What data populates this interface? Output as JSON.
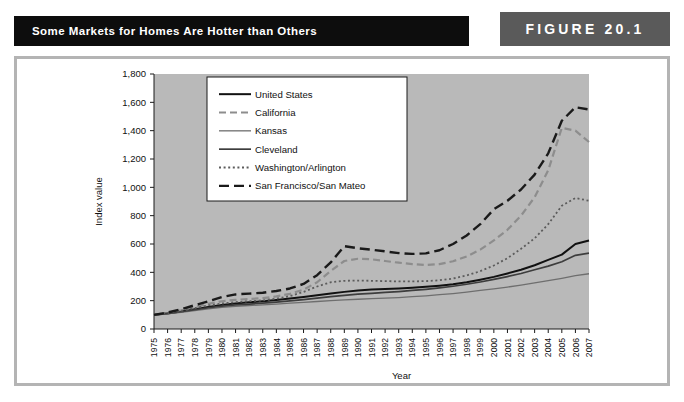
{
  "header": {
    "title": "Some Markets for Homes Are Hotter than Others",
    "figure_label": "FIGURE 20.1"
  },
  "chart_data": {
    "type": "line",
    "title": "Some Markets for Homes Are Hotter than Others",
    "xlabel": "Year",
    "ylabel": "Index value",
    "ylim": [
      0,
      1800
    ],
    "ytick_step": 200,
    "yticks": [
      "0",
      "200",
      "400",
      "600",
      "800",
      "1,000",
      "1,200",
      "1,400",
      "1,600",
      "1,800"
    ],
    "grid": false,
    "legend_position": "top-left-inside",
    "plot_background": "#b9b9b9",
    "x": [
      1975,
      1976,
      1977,
      1978,
      1979,
      1980,
      1981,
      1982,
      1983,
      1984,
      1985,
      1986,
      1987,
      1988,
      1989,
      1990,
      1991,
      1992,
      1993,
      1994,
      1995,
      1996,
      1997,
      1998,
      1999,
      2000,
      2001,
      2002,
      2003,
      2004,
      2005,
      2006,
      2007
    ],
    "xticklabels": [
      "1975",
      "1976",
      "1977",
      "1978",
      "1979",
      "1980",
      "1981",
      "1982",
      "1983",
      "1984",
      "1985",
      "1986",
      "1987",
      "1988",
      "1989",
      "1990",
      "1991",
      "1992",
      "1993",
      "1994",
      "1995",
      "1996",
      "1997",
      "1998",
      "1999",
      "2000",
      "2001",
      "2002",
      "2003",
      "2004",
      "2005",
      "2006",
      "2007"
    ],
    "series": [
      {
        "name": "United States",
        "style": "solid",
        "color": "#111111",
        "width": 2.0,
        "dash": "",
        "values": [
          100,
          110,
          124,
          140,
          156,
          170,
          180,
          188,
          196,
          205,
          215,
          226,
          238,
          250,
          262,
          272,
          278,
          282,
          286,
          292,
          298,
          306,
          316,
          330,
          348,
          368,
          392,
          418,
          450,
          488,
          525,
          600,
          625
        ]
      },
      {
        "name": "California",
        "style": "dashed-light",
        "color": "#8d8d8d",
        "width": 2.2,
        "dash": "7,4",
        "values": [
          100,
          112,
          132,
          156,
          178,
          196,
          206,
          212,
          218,
          230,
          248,
          278,
          330,
          410,
          480,
          496,
          492,
          480,
          468,
          458,
          452,
          458,
          478,
          512,
          560,
          625,
          700,
          800,
          930,
          1120,
          1420,
          1400,
          1320
        ]
      },
      {
        "name": "Kansas",
        "style": "solid-light",
        "color": "#6e6e6e",
        "width": 1.3,
        "dash": "",
        "values": [
          100,
          108,
          118,
          130,
          142,
          152,
          160,
          166,
          170,
          176,
          182,
          188,
          194,
          200,
          206,
          210,
          214,
          218,
          222,
          228,
          234,
          242,
          250,
          260,
          272,
          284,
          296,
          310,
          326,
          342,
          358,
          376,
          390
        ]
      },
      {
        "name": "Cleveland",
        "style": "solid-mid",
        "color": "#3d3d3d",
        "width": 1.7,
        "dash": "",
        "values": [
          100,
          110,
          122,
          136,
          150,
          162,
          170,
          176,
          182,
          190,
          198,
          208,
          218,
          228,
          238,
          246,
          252,
          258,
          264,
          272,
          280,
          290,
          302,
          316,
          332,
          350,
          370,
          392,
          418,
          444,
          475,
          520,
          535
        ]
      },
      {
        "name": "Washington/Arlington",
        "style": "dotted",
        "color": "#5c5c5c",
        "width": 1.8,
        "dash": "2,2.6",
        "values": [
          100,
          112,
          128,
          148,
          166,
          180,
          190,
          196,
          202,
          214,
          232,
          262,
          300,
          330,
          340,
          342,
          340,
          338,
          336,
          336,
          338,
          344,
          356,
          378,
          408,
          448,
          500,
          566,
          640,
          740,
          870,
          925,
          905
        ]
      },
      {
        "name": "San Francisco/San Mateo",
        "style": "dashed-dark",
        "color": "#1a1a1a",
        "width": 2.4,
        "dash": "10,5",
        "values": [
          100,
          116,
          140,
          168,
          196,
          226,
          244,
          250,
          256,
          268,
          286,
          318,
          380,
          470,
          585,
          570,
          560,
          548,
          536,
          530,
          534,
          556,
          600,
          660,
          740,
          845,
          905,
          985,
          1090,
          1240,
          1470,
          1565,
          1550
        ]
      }
    ]
  }
}
